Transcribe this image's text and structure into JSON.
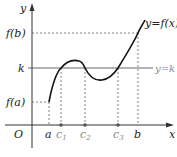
{
  "diagram": {
    "axes": {
      "x_label": "x",
      "y_label": "y",
      "origin_label": "O"
    },
    "y_ticks": [
      {
        "id": "fb",
        "label": "f(b)"
      },
      {
        "id": "k",
        "label": "k"
      },
      {
        "id": "fa",
        "label": "f(a)"
      }
    ],
    "x_ticks": [
      {
        "id": "a",
        "label": "a",
        "sub": ""
      },
      {
        "id": "c1",
        "label": "c",
        "sub": "1"
      },
      {
        "id": "c2",
        "label": "c",
        "sub": "2"
      },
      {
        "id": "c3",
        "label": "c",
        "sub": "3"
      },
      {
        "id": "b",
        "label": "b",
        "sub": ""
      }
    ],
    "curve_label": "y=f(x)",
    "line_label": "y=k",
    "colors": {
      "axis": "#333333",
      "curve": "#111111",
      "k_line": "#555555",
      "k_label": "#7a8a9a",
      "dashed": "#666666",
      "point": "#555555"
    }
  }
}
